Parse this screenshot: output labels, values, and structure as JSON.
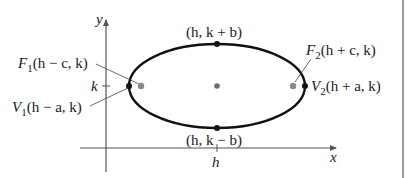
{
  "diagram": {
    "type": "ellipse-horizontal-major-axis",
    "axes": {
      "x_label": "x",
      "y_label": "y",
      "x_tick_label": "h",
      "y_tick_label": "k"
    },
    "points": {
      "top_vertex": "(h, k + b)",
      "bottom_vertex": "(h, k − b)",
      "focus1": {
        "name": "F",
        "sub": "1",
        "coords": "(h − c, k)"
      },
      "focus2": {
        "name": "F",
        "sub": "2",
        "coords": "(h + c, k)"
      },
      "vertex1": {
        "name": "V",
        "sub": "1",
        "coords": "(h − a, k)"
      },
      "vertex2": {
        "name": "V",
        "sub": "2",
        "coords": "(h + a, k)"
      }
    },
    "colors": {
      "curve": "#111111",
      "axis": "#555555",
      "focus_dot": "#8a8a8a",
      "center_dot": "#6e6e6e",
      "vertex_dot": "#111111",
      "leader_line": "#444444"
    }
  }
}
